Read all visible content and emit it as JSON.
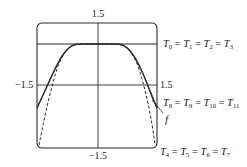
{
  "figure": {
    "type": "taylor-polynomial-approximation",
    "colors": {
      "ink": "#2a2a2a",
      "background": "#ffffff"
    },
    "axis_ticks": {
      "top": "1.5",
      "bottom": "−1.5",
      "left": "−1.5",
      "right": "1.5"
    },
    "curve_labels": {
      "top_line": {
        "text": "T0 = T1 = T2 = T3",
        "terms": [
          {
            "T": "T",
            "sub": "0"
          },
          {
            "T": "T",
            "sub": "1"
          },
          {
            "T": "T",
            "sub": "2"
          },
          {
            "T": "T",
            "sub": "3"
          }
        ]
      },
      "solid_curve": {
        "text": "T8 = T9 = T10 = T11",
        "terms": [
          {
            "T": "T",
            "sub": "8"
          },
          {
            "T": "T",
            "sub": "9"
          },
          {
            "T": "T",
            "sub": "10"
          },
          {
            "T": "T",
            "sub": "11"
          }
        ]
      },
      "function": "f",
      "dashed_curve": {
        "text": "T4 = T5 = T6 = T7",
        "terms": [
          {
            "T": "T",
            "sub": "4"
          },
          {
            "T": "T",
            "sub": "5"
          },
          {
            "T": "T",
            "sub": "6"
          },
          {
            "T": "T",
            "sub": "7"
          }
        ]
      }
    },
    "separator": "="
  }
}
